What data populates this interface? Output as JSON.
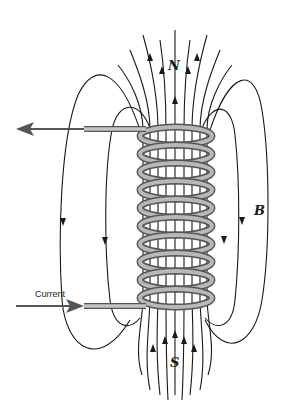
{
  "diagram": {
    "labels": {
      "north": "N",
      "south": "S",
      "field": "B",
      "current": "Current"
    },
    "coil": {
      "turns": 10,
      "color": "#7a7a7a",
      "highlight": "#b8b8b8"
    },
    "field_line_color": "#1a1a1a"
  }
}
